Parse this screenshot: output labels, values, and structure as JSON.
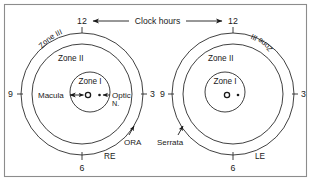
{
  "figure": {
    "title_text": "Clock hours",
    "border_color": "#8c8c8c",
    "line_color": "#1a1a1a",
    "background": "#ffffff"
  },
  "clock_label": "Clock hours",
  "right_eye": {
    "id": "RE",
    "eye_label": "RE",
    "zones": [
      {
        "key": "zone1",
        "label": "Zone I"
      },
      {
        "key": "zone2",
        "label": "Zone II"
      },
      {
        "key": "zone3",
        "label": "Zone III"
      }
    ],
    "hours": [
      {
        "key": "top",
        "label": "12"
      },
      {
        "key": "left",
        "label": "9"
      },
      {
        "key": "right",
        "label": "3"
      },
      {
        "key": "bottom",
        "label": "6"
      }
    ],
    "anatomy": [
      {
        "key": "macula",
        "label": "Macula"
      },
      {
        "key": "optic_nerve",
        "label": "Optic"
      },
      {
        "key": "optic_nerve_second_line",
        "label": "N."
      },
      {
        "key": "ora",
        "label": "ORA"
      }
    ]
  },
  "left_eye": {
    "id": "LE",
    "eye_label": "LE",
    "zones": [
      {
        "key": "zone1",
        "label": "Zone I"
      },
      {
        "key": "zone2",
        "label": "Zone II"
      },
      {
        "key": "zone3",
        "label": "Zone III"
      }
    ],
    "hours": [
      {
        "key": "top",
        "label": "12"
      },
      {
        "key": "left",
        "label": "9"
      },
      {
        "key": "right",
        "label": "3"
      },
      {
        "key": "bottom",
        "label": "6"
      }
    ],
    "anatomy": [
      {
        "key": "serrata",
        "label": "Serrata"
      }
    ]
  }
}
